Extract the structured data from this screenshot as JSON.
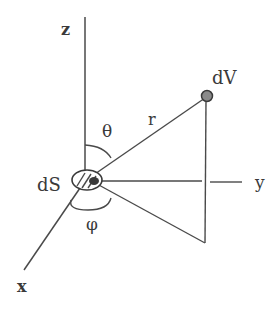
{
  "diagram": {
    "type": "spherical-coordinate-geometry",
    "labels": {
      "z_axis": "z",
      "y_axis": "y",
      "x_axis": "x",
      "theta": "θ",
      "phi": "φ",
      "radius": "r",
      "volume_element": "dV",
      "surface_element": "dS"
    },
    "colors": {
      "line": "#4a4a4a",
      "text": "#3a3a3a",
      "point_fill": "#8a8a8a",
      "background": "#ffffff"
    }
  }
}
